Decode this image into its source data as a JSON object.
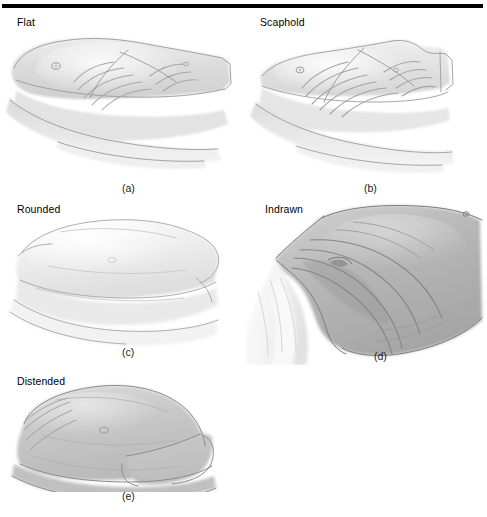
{
  "figure": {
    "kind": "medical-illustration-plate",
    "background_color": "#ffffff",
    "rule_color": "#000000",
    "panels": [
      {
        "id": "a",
        "label": "Flat",
        "caption": "(a)",
        "tone": "#d9d9d9",
        "features": "flat abdomen, visible rib cage, umbilicus, arm resting across lower body"
      },
      {
        "id": "b",
        "label": "Scaphold",
        "caption": "(b)",
        "tone": "#dedede",
        "features": "scaphoid hollowed abdomen, prominent ribs, arm resting across lower body"
      },
      {
        "id": "c",
        "label": "Rounded",
        "caption": "(c)",
        "tone": "#e6e6e6",
        "features": "smoothly rounded convex abdomen, no rib definition"
      },
      {
        "id": "d",
        "label": "Indrawn",
        "caption": "(d)",
        "tone": "#b4b4b4",
        "features": "deeply indrawn abdomen with oblique skin folds and white drape at lower left"
      },
      {
        "id": "e",
        "label": "Distended",
        "caption": "(e)",
        "tone": "#c4c4c4",
        "features": "markedly distended dome-shaped abdomen overhanging the flank"
      }
    ]
  }
}
